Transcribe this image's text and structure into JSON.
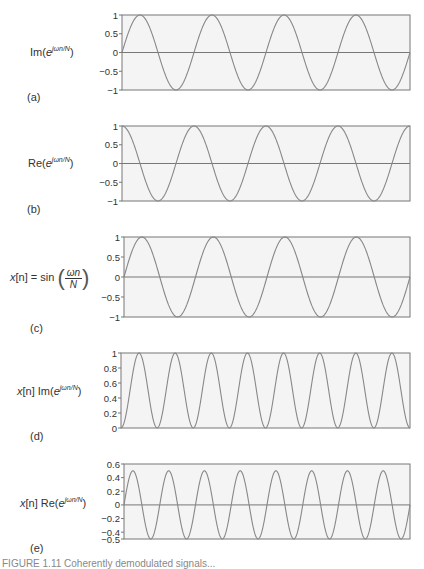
{
  "colors": {
    "background": "#ffffff",
    "plot_fill": "#f4f4f4",
    "frame": "#777777",
    "curve": "#888888",
    "zero_line": "#777777",
    "text": "#333333"
  },
  "caption": "FIGURE 1.11  Coherently demodulated signals...",
  "chart_data": [
    {
      "type": "line",
      "panel": "(a)",
      "ylabel": "Im(e^{jωn/N})",
      "function": "sin",
      "cycles": 4,
      "amplitude": 1,
      "ylim": [
        -1,
        1
      ],
      "yticks": [
        1,
        0.5,
        0,
        -0.5,
        -1
      ],
      "ytick_labels": [
        "1",
        "0.5",
        "0",
        "−0.5",
        "−1"
      ],
      "zero_line": true,
      "grid": false,
      "box": {
        "x": 122,
        "y": 15,
        "w": 288,
        "h": 75
      }
    },
    {
      "type": "line",
      "panel": "(b)",
      "ylabel": "Re(e^{jωn/N})",
      "function": "cos",
      "cycles": 4,
      "amplitude": 1,
      "ylim": [
        -1,
        1
      ],
      "yticks": [
        1,
        0.5,
        0,
        -0.5,
        -1
      ],
      "ytick_labels": [
        "1",
        "0.5",
        "0",
        "−0.5",
        "−1"
      ],
      "zero_line": true,
      "grid": false,
      "box": {
        "x": 122,
        "y": 126,
        "w": 288,
        "h": 75
      }
    },
    {
      "type": "line",
      "panel": "(c)",
      "ylabel": "x[n] = sin(ωn/N)",
      "function": "sin",
      "cycles": 4,
      "amplitude": 1,
      "ylim": [
        -1,
        1
      ],
      "yticks": [
        1,
        0.5,
        0,
        -0.5,
        -1
      ],
      "ytick_labels": [
        "1",
        "0.5",
        "0",
        "−0.5",
        "−1"
      ],
      "zero_line": true,
      "grid": false,
      "box": {
        "x": 124,
        "y": 237,
        "w": 286,
        "h": 80
      }
    },
    {
      "type": "line",
      "panel": "(d)",
      "ylabel": "x[n] Im(e^{jωn/N})",
      "function": "sin2",
      "cycles": 4,
      "amplitude": 1,
      "ylim": [
        0,
        1
      ],
      "yticks": [
        1,
        0.8,
        0.6,
        0.4,
        0.2,
        0
      ],
      "ytick_labels": [
        "1",
        "0.8",
        "0.6",
        "0.4",
        "0.2",
        "0"
      ],
      "zero_line": false,
      "grid": false,
      "box": {
        "x": 121,
        "y": 353,
        "w": 289,
        "h": 75
      }
    },
    {
      "type": "line",
      "panel": "(e)",
      "ylabel": "x[n] Re(e^{jωn/N})",
      "function": "sincos",
      "cycles": 4,
      "amplitude": 0.5,
      "ylim": [
        -0.5,
        0.6
      ],
      "yticks": [
        0.6,
        0.4,
        0.2,
        0,
        -0.2,
        -0.4,
        -0.5
      ],
      "ytick_labels": [
        "0.6",
        "0.4",
        "0.2",
        "0",
        "−0.2",
        "−0.4",
        "−0.5"
      ],
      "zero_line": true,
      "grid": false,
      "box": {
        "x": 124,
        "y": 464,
        "w": 286,
        "h": 75
      }
    }
  ],
  "labels": {
    "a": {
      "pre": "Im(",
      "base": "e",
      "sup": "jωn/N",
      "post": ")",
      "tag": "(a)"
    },
    "b": {
      "pre": "Re(",
      "base": "e",
      "sup": "jωn/N",
      "post": ")",
      "tag": "(b)"
    },
    "c": {
      "lhs": "x",
      "idx": "[n] = sin",
      "num": "ωn",
      "den": "N",
      "tag": "(c)"
    },
    "d": {
      "x": "x",
      "idx": "[n] Im(",
      "base": "e",
      "sup": "jωn/N",
      "post": ")",
      "tag": "(d)"
    },
    "e": {
      "x": "x",
      "idx": "[n] Re(",
      "base": "e",
      "sup": "jωn/N",
      "post": ")",
      "tag": "(e)"
    }
  }
}
